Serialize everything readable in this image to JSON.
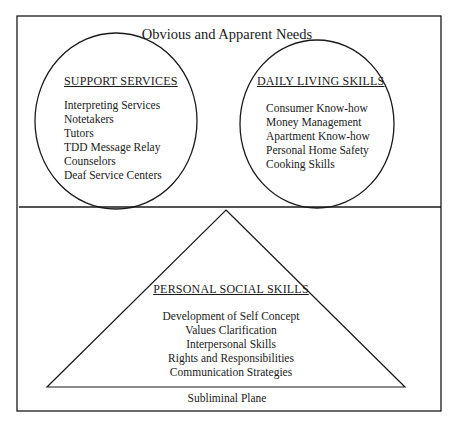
{
  "diagram": {
    "title": "Obvious and Apparent Needs",
    "footer_label": "Subliminal Plane",
    "support_services": {
      "heading": "SUPPORT SERVICES",
      "items": [
        "Interpreting Services",
        "Notetakers",
        "Tutors",
        "TDD Message Relay",
        "Counselors",
        "Deaf Service Centers"
      ]
    },
    "daily_living_skills": {
      "heading": "DAILY LIVING SKILLS",
      "items": [
        "Consumer Know-how",
        "Money Management",
        "Apartment Know-how",
        "Personal Home Safety",
        "Cooking Skills"
      ]
    },
    "personal_social_skills": {
      "heading": "PERSONAL SOCIAL SKILLS",
      "items": [
        "Development of Self Concept",
        "Values Clarification",
        "Interpersonal Skills",
        "Rights and Responsibilities",
        "Communication Strategies"
      ]
    },
    "colors": {
      "line": "#1a1a1a",
      "background": "#ffffff"
    }
  }
}
